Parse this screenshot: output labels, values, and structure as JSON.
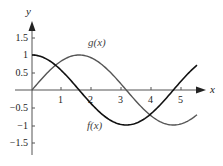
{
  "chart_data": {
    "type": "line",
    "title": "",
    "xlabel": "x",
    "ylabel": "y",
    "xlim": [
      0,
      5.5
    ],
    "ylim": [
      -1.5,
      1.5
    ],
    "grid": false,
    "legend": "inline labels",
    "x_ticks": [
      1,
      2,
      3,
      4,
      5
    ],
    "x_tick_labels": [
      "1",
      "2",
      "3",
      "4",
      "5"
    ],
    "y_ticks": [
      1.5,
      1,
      0.5,
      -0.5,
      -1,
      -1.5
    ],
    "y_tick_labels": [
      "1.5",
      "1",
      "0.5",
      "-0.5",
      "-1",
      "-1.5"
    ],
    "series": [
      {
        "name": "f(x)",
        "function": "cos(x)",
        "color": "#111111",
        "x": [
          0,
          0.5,
          1,
          1.5,
          2,
          2.5,
          3,
          3.5,
          4,
          4.5,
          5,
          5.5
        ],
        "values": [
          1,
          0.88,
          0.54,
          0.07,
          -0.42,
          -0.8,
          -0.99,
          -0.94,
          -0.65,
          -0.21,
          0.28,
          0.71
        ]
      },
      {
        "name": "g(x)",
        "function": "sin(x)",
        "color": "#555555",
        "x": [
          0,
          0.5,
          1,
          1.5,
          2,
          2.5,
          3,
          3.5,
          4,
          4.5,
          5,
          5.5
        ],
        "values": [
          0,
          0.48,
          0.84,
          1.0,
          0.91,
          0.6,
          0.14,
          -0.35,
          -0.76,
          -0.98,
          -0.96,
          -0.71
        ]
      }
    ],
    "annotations": [
      {
        "text": "g(x)",
        "near_x": 2.4,
        "near_y": 1.2
      },
      {
        "text": "f(x)",
        "near_x": 2.3,
        "near_y": -1.0
      }
    ]
  },
  "labels": {
    "x_axis": "x",
    "y_axis": "y",
    "f_label": "f(x)",
    "g_label": "g(x)",
    "x_ticks": [
      "1",
      "2",
      "3",
      "4",
      "5"
    ],
    "y_ticks": [
      "1.5",
      "1",
      "0.5",
      "−0.5",
      "−1",
      "−1.5"
    ]
  }
}
